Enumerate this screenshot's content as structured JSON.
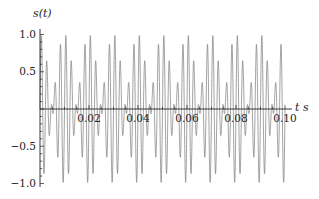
{
  "chart_data": {
    "type": "line",
    "title": "",
    "xlabel": "t s",
    "ylabel": "s(t)",
    "xlim": [
      0,
      0.1
    ],
    "ylim": [
      -1.05,
      1.05
    ],
    "grid": false,
    "legend": null,
    "x_ticks": [
      0.02,
      0.04,
      0.06,
      0.08,
      0.1
    ],
    "x_tick_labels": [
      "0.02",
      "0.04",
      "0.06",
      "0.08",
      "0.10"
    ],
    "y_ticks": [
      1.0,
      0.5,
      -0.5,
      -1.0
    ],
    "y_tick_labels": [
      "1.0",
      "0.5",
      "−0.5",
      "−1.0"
    ],
    "series": [
      {
        "name": "s(t)",
        "color": "#7a7a7a",
        "formula": "0.5*sin(2*pi*400*t) + 0.5*sin(2*pi*500*t)",
        "components": [
          {
            "amplitude": 0.5,
            "frequency_hz": 400
          },
          {
            "amplitude": 0.5,
            "frequency_hz": 500
          }
        ],
        "samples": 4000
      }
    ]
  },
  "axes": {
    "y_label": "s(t)",
    "x_label": "t s"
  }
}
